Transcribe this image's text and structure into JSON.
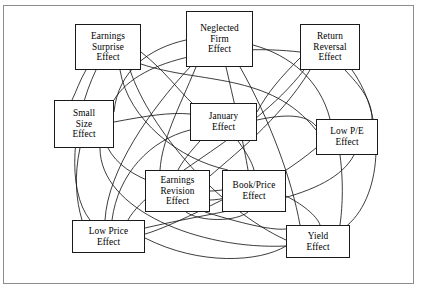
{
  "figure": {
    "type": "relationship-diagram",
    "frame_border_color": "#8d8d8d",
    "background_color": "#ffffff",
    "box_border_color": "#1a1a1a",
    "edge_color": "#1a1a1a"
  },
  "nodes": [
    {
      "id": "earnings-surprise-effect",
      "lines": [
        "Earnings",
        "Surprise",
        "Effect"
      ],
      "x": 75,
      "y": 24,
      "w": 66,
      "h": 46
    },
    {
      "id": "neglected-firm-effect",
      "lines": [
        "Neglected",
        "Firm",
        "Effect"
      ],
      "x": 186,
      "y": 11,
      "w": 67,
      "h": 56
    },
    {
      "id": "return-reversal-effect",
      "lines": [
        "Return",
        "Reversal",
        "Effect"
      ],
      "x": 300,
      "y": 24,
      "w": 60,
      "h": 46
    },
    {
      "id": "small-size-effect",
      "lines": [
        "Small",
        "Size",
        "Effect"
      ],
      "x": 54,
      "y": 100,
      "w": 60,
      "h": 48
    },
    {
      "id": "january-effect",
      "lines": [
        "January",
        "Effect"
      ],
      "x": 190,
      "y": 103,
      "w": 67,
      "h": 38
    },
    {
      "id": "low-pe-effect",
      "lines": [
        "Low P/E",
        "Effect"
      ],
      "x": 316,
      "y": 119,
      "w": 62,
      "h": 36
    },
    {
      "id": "earnings-revision-effect",
      "lines": [
        "Earnings",
        "Revision",
        "Effect"
      ],
      "x": 145,
      "y": 170,
      "w": 65,
      "h": 42
    },
    {
      "id": "book-price-effect",
      "lines": [
        "Book/Price",
        "Effect"
      ],
      "x": 222,
      "y": 170,
      "w": 64,
      "h": 42
    },
    {
      "id": "low-price-effect",
      "lines": [
        "Low Price",
        "Effect"
      ],
      "x": 72,
      "y": 220,
      "w": 73,
      "h": 33
    },
    {
      "id": "yield-effect",
      "lines": [
        "Yield",
        "Effect"
      ],
      "x": 286,
      "y": 225,
      "w": 64,
      "h": 33
    }
  ],
  "edges": [
    {
      "from": "earnings-surprise-effect",
      "to": "low-pe-effect",
      "d": "M141,64 C200,84 270,72 316,130"
    },
    {
      "from": "earnings-surprise-effect",
      "to": "low-price-effect",
      "d": "M96,70 C72,120 66,190 90,220"
    },
    {
      "from": "earnings-surprise-effect",
      "to": "yield-effect",
      "d": "M130,70 C150,130 220,210 286,240"
    },
    {
      "from": "earnings-surprise-effect",
      "to": "book-price-effect",
      "d": "M120,70 C128,120 180,160 228,170"
    },
    {
      "from": "neglected-firm-effect",
      "to": "small-size-effect",
      "d": "M186,40 C150,48 118,70 114,112"
    },
    {
      "from": "neglected-firm-effect",
      "to": "earnings-revision-effect",
      "d": "M196,67 C178,110 162,140 160,170"
    },
    {
      "from": "neglected-firm-effect",
      "to": "low-price-effect",
      "d": "M190,67 C150,110 108,170 105,220"
    },
    {
      "from": "neglected-firm-effect",
      "to": "yield-effect",
      "d": "M240,67 C270,120 292,180 300,225"
    },
    {
      "from": "neglected-firm-effect",
      "to": "low-pe-effect",
      "d": "M253,45 C290,55 320,80 330,119"
    },
    {
      "from": "return-reversal-effect",
      "to": "small-size-effect",
      "d": "M300,52 C230,44 140,56 114,100"
    },
    {
      "from": "return-reversal-effect",
      "to": "january-effect",
      "d": "M300,58 C280,78 268,92 257,112"
    },
    {
      "from": "return-reversal-effect",
      "to": "low-pe-effect",
      "d": "M345,70 C360,86 372,100 372,119"
    },
    {
      "from": "return-reversal-effect",
      "to": "yield-effect",
      "d": "M352,70 C388,120 382,200 344,228"
    },
    {
      "from": "small-size-effect",
      "to": "january-effect",
      "d": "M114,122 C146,116 170,112 190,114"
    },
    {
      "from": "small-size-effect",
      "to": "yield-effect",
      "d": "M100,148 C100,210 200,250 286,246"
    },
    {
      "from": "small-size-effect",
      "to": "low-price-effect",
      "d": "M80,148 C74,176 76,200 82,220"
    },
    {
      "from": "january-effect",
      "to": "earnings-revision-effect",
      "d": "M200,141 C190,152 182,162 178,170"
    },
    {
      "from": "january-effect",
      "to": "book-price-effect",
      "d": "M238,141 C246,152 252,162 254,170"
    },
    {
      "from": "january-effect",
      "to": "low-pe-effect",
      "d": "M257,120 C285,114 306,114 316,126"
    },
    {
      "from": "january-effect",
      "to": "low-price-effect",
      "d": "M190,130 C150,140 118,174 112,220"
    },
    {
      "from": "earnings-revision-effect",
      "to": "book-price-effect",
      "d": "M186,212 C200,222 236,222 248,212"
    },
    {
      "from": "earnings-revision-effect",
      "to": "yield-effect",
      "d": "M205,212 C250,226 280,232 290,228"
    },
    {
      "from": "book-price-effect",
      "to": "yield-effect",
      "d": "M286,196 C306,206 318,218 320,225"
    },
    {
      "from": "book-price-effect",
      "to": "low-price-effect",
      "d": "M222,200 C190,216 160,230 145,234"
    },
    {
      "from": "low-price-effect",
      "to": "yield-effect",
      "d": "M145,238 C200,266 260,262 286,246"
    },
    {
      "from": "low-price-effect",
      "to": "low-pe-effect",
      "d": "M145,228 C240,206 330,200 354,155"
    },
    {
      "from": "earnings-surprise-effect",
      "to": "january-effect",
      "d": "M141,52 C164,70 180,92 192,103"
    },
    {
      "from": "return-reversal-effect",
      "to": "earnings-revision-effect",
      "d": "M310,70 C280,120 230,158 210,176"
    },
    {
      "from": "small-size-effect",
      "to": "book-price-effect",
      "d": "M108,148 C124,180 180,196 222,190"
    },
    {
      "from": "neglected-firm-effect",
      "to": "book-price-effect",
      "d": "M226,67 C236,110 244,146 248,170"
    },
    {
      "from": "earnings-surprise-effect",
      "to": "small-size-effect",
      "d": "M86,70 C80,80 76,92 72,100"
    },
    {
      "from": "low-pe-effect",
      "to": "yield-effect",
      "d": "M340,155 C344,186 342,210 340,225"
    },
    {
      "from": "low-pe-effect",
      "to": "earnings-revision-effect",
      "d": "M316,148 C270,186 230,200 210,200"
    },
    {
      "from": "return-reversal-effect",
      "to": "low-price-effect",
      "d": "M304,70 C250,140 150,180 128,220"
    }
  ]
}
